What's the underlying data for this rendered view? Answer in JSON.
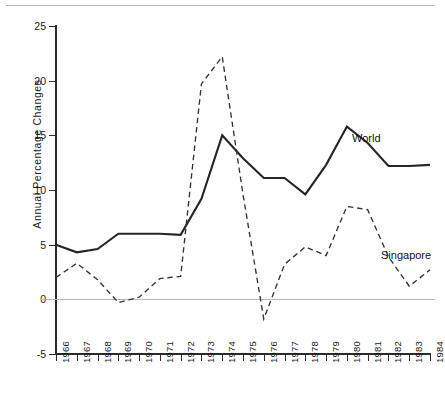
{
  "chart_data": {
    "type": "line",
    "title": "",
    "xlabel": "",
    "ylabel": "Annual  Percentage  Changes",
    "x": [
      1966,
      1967,
      1968,
      1969,
      1970,
      1971,
      1972,
      1973,
      1974,
      1975,
      1976,
      1977,
      1978,
      1979,
      1980,
      1981,
      1982,
      1983,
      1984
    ],
    "categories": [
      "1966",
      "1967",
      "1968",
      "1969",
      "1970",
      "1971",
      "1972",
      "1973",
      "1974",
      "1975",
      "1976",
      "1977",
      "1978",
      "1979",
      "1980",
      "1981",
      "1982",
      "1983",
      "1984"
    ],
    "xlim": [
      1966,
      1984
    ],
    "ylim": [
      -5,
      25
    ],
    "yticks": [
      -5,
      0,
      5,
      10,
      15,
      20,
      25
    ],
    "ytick_labels": [
      "-5",
      "0",
      "5",
      "10",
      "15",
      "20",
      "25"
    ],
    "grid": false,
    "zero_reference_line": 0,
    "legend": "inline-labels",
    "series": [
      {
        "name": "World",
        "style": "solid",
        "color": "#262626",
        "values": [
          5.0,
          4.3,
          4.6,
          6.0,
          6.0,
          6.0,
          5.9,
          9.2,
          15.0,
          12.9,
          11.1,
          11.1,
          9.6,
          12.3,
          15.8,
          14.3,
          12.2,
          12.2,
          12.3
        ]
      },
      {
        "name": "Singapore",
        "style": "dashed",
        "color": "#333333",
        "values": [
          2.0,
          3.3,
          1.8,
          -0.3,
          0.2,
          1.9,
          2.1,
          19.7,
          22.2,
          9.6,
          -1.8,
          3.2,
          4.8,
          4.0,
          8.5,
          8.2,
          3.9,
          1.2,
          2.7
        ]
      }
    ],
    "annotations": [
      {
        "text": "World",
        "series": "World",
        "x": 1981,
        "y": 15.0
      },
      {
        "text": "Singapore",
        "series": "Singapore",
        "x": 1983,
        "y": 5.0
      }
    ]
  },
  "axis": {
    "y_title": "Annual  Percentage  Changes"
  }
}
